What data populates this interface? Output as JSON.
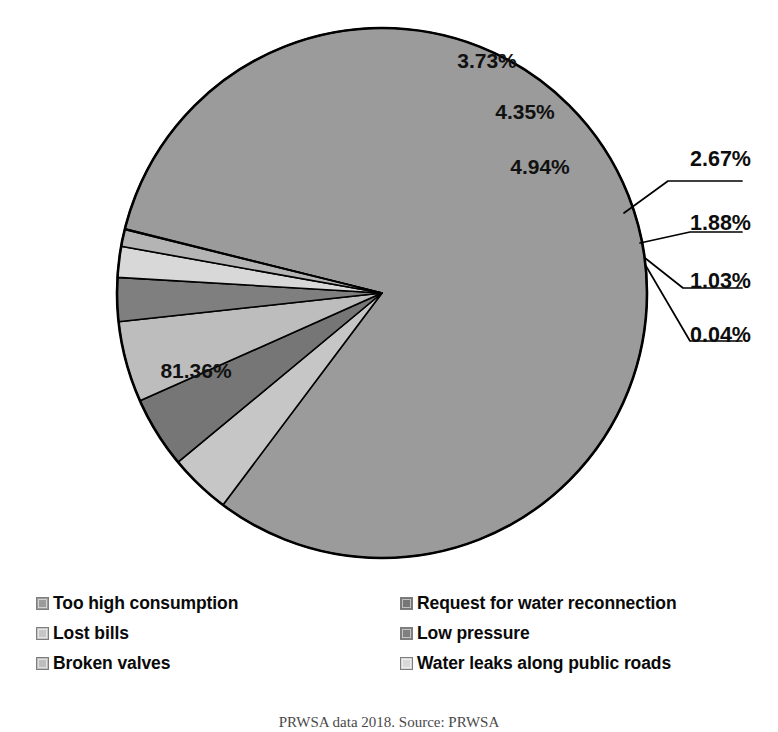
{
  "chart_data": {
    "type": "pie",
    "title": "",
    "start_angle_deg": -76,
    "direction": "clockwise",
    "center": [
      382,
      293
    ],
    "radius": 265,
    "labels": [
      "Too high consumption",
      "Lost bills",
      "Request for water reconnection",
      "Low pressure",
      "Broken valves",
      "Water leaks along public roads",
      "Other"
    ],
    "slices": [
      {
        "name": "too-high-consumption",
        "label": "Too high consumption",
        "value": 81.36,
        "display": "81.36%",
        "color": "#9b9b9b",
        "label_mode": "inside",
        "label_xy": [
          196,
          378
        ]
      },
      {
        "name": "lost-bills",
        "label": "Lost bills",
        "value": 3.73,
        "display": "3.73%",
        "color": "#c6c6c6",
        "label_mode": "inside",
        "label_xy": [
          487,
          68
        ]
      },
      {
        "name": "request-for-water-reconnection",
        "label": "Request for water reconnection",
        "value": 4.35,
        "display": "4.35%",
        "color": "#767676",
        "label_mode": "inside",
        "label_xy": [
          525,
          119
        ]
      },
      {
        "name": "broken-valves",
        "label": "Broken valves",
        "value": 4.94,
        "display": "4.94%",
        "color": "#bdbdbd",
        "label_mode": "inside",
        "label_xy": [
          540,
          174
        ]
      },
      {
        "name": "low-pressure",
        "label": "Low pressure",
        "value": 2.67,
        "display": "2.67%",
        "color": "#7f7f7f",
        "label_mode": "callout",
        "label_xy": [
          690,
          166
        ],
        "leader": [
          [
            624,
            213
          ],
          [
            668,
            181
          ],
          [
            742,
            181
          ]
        ]
      },
      {
        "name": "water-leaks-along-public-roads",
        "label": "Water leaks along public roads",
        "value": 1.88,
        "display": "1.88%",
        "color": "#d8d8d8",
        "label_mode": "callout",
        "label_xy": [
          690,
          230
        ],
        "leader": [
          [
            640,
            243
          ],
          [
            690,
            232
          ],
          [
            742,
            232
          ]
        ]
      },
      {
        "name": "small-slice-1-03",
        "label": "",
        "value": 1.03,
        "display": "1.03%",
        "color": "#b4b4b4",
        "label_mode": "callout",
        "label_xy": [
          690,
          288
        ],
        "leader": [
          [
            645,
            258
          ],
          [
            683,
            288
          ],
          [
            742,
            288
          ]
        ]
      },
      {
        "name": "small-slice-0-04",
        "label": "",
        "value": 0.04,
        "display": "0.04%",
        "color": "#8d8d8d",
        "label_mode": "callout",
        "label_xy": [
          690,
          342
        ],
        "leader": [
          [
            646,
            266
          ],
          [
            690,
            341
          ],
          [
            742,
            341
          ]
        ]
      }
    ]
  },
  "legend": {
    "rows": [
      {
        "left": {
          "label": "Too high consumption",
          "color": "#9b9b9b",
          "name": "legend-item-too-high-consumption"
        },
        "right": {
          "label": "Request for water reconnection",
          "color": "#767676",
          "name": "legend-item-request-for-water-reconnection"
        }
      },
      {
        "left": {
          "label": "Lost bills",
          "color": "#c6c6c6",
          "name": "legend-item-lost-bills"
        },
        "right": {
          "label": "Low pressure",
          "color": "#7f7f7f",
          "name": "legend-item-low-pressure"
        }
      },
      {
        "left": {
          "label": "Broken valves",
          "color": "#bdbdbd",
          "name": "legend-item-broken-valves"
        },
        "right": {
          "label": "Water leaks along public roads",
          "color": "#d8d8d8",
          "name": "legend-item-water-leaks-along-public-roads"
        }
      }
    ]
  },
  "caption": {
    "text": "PRWSA data 2018. Source: PRWSA"
  },
  "colors": {
    "outline": "#000000",
    "text": "#0a0a0a",
    "background": "#ffffff"
  }
}
